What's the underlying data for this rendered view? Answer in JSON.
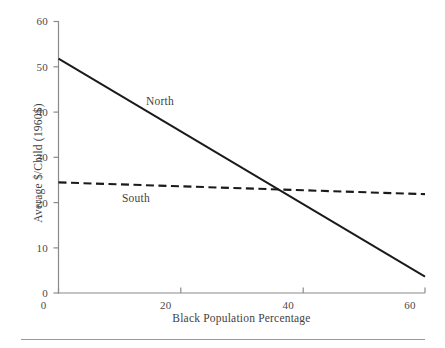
{
  "chart_data": {
    "type": "line",
    "title": "",
    "subtitle": "",
    "xlabel": "Black Population Percentage",
    "ylabel": "Average $/Child (1960$)",
    "xlim": [
      0,
      60
    ],
    "ylim": [
      0,
      60
    ],
    "xticks": [
      0,
      20,
      40,
      60
    ],
    "xtick_labels": [
      "0",
      "20",
      "40",
      "60"
    ],
    "yticks": [
      0,
      10,
      20,
      30,
      40,
      50,
      60
    ],
    "ytick_labels": [
      "0",
      "10",
      "20",
      "30",
      "40",
      "50",
      "60"
    ],
    "grid": false,
    "legend_position": "inline-annotations",
    "series": [
      {
        "name": "North",
        "style": "solid",
        "color": "#1a1a1a",
        "x": [
          0,
          60
        ],
        "values": [
          51.7,
          3.6
        ],
        "annotation": "North"
      },
      {
        "name": "South",
        "style": "dashed",
        "color": "#1a1a1a",
        "x": [
          0,
          60
        ],
        "values": [
          24.4,
          21.8
        ],
        "annotation": "South"
      }
    ],
    "annotations": [
      {
        "text": "North",
        "x": 14.5,
        "y": 43.5
      },
      {
        "text": "South",
        "x": 10.5,
        "y": 22.0
      }
    ],
    "intersection": {
      "x": 36.5,
      "y": 22.8
    },
    "colors": {
      "axis": "#8a8a8a",
      "tick_text": "#4a4a4a",
      "series_north": "#1a1a1a",
      "series_south": "#1a1a1a",
      "footer_rule": "#9a9a9a",
      "background": "#ffffff"
    }
  },
  "figure": {
    "footer_rule_visible": true
  }
}
